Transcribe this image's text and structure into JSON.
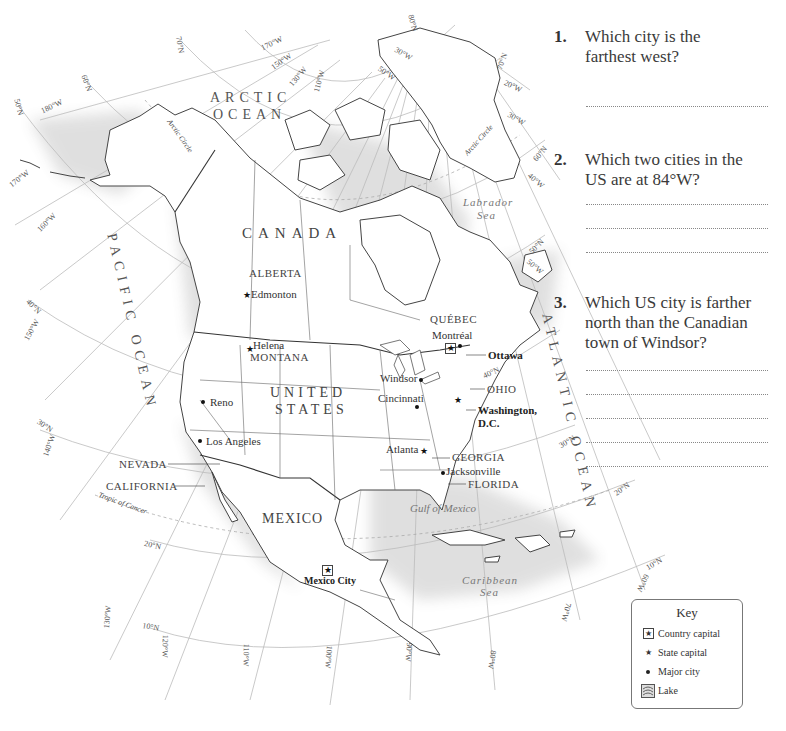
{
  "questions": [
    {
      "number": "1.",
      "lines": [
        "Which city is the",
        "farthest west?"
      ],
      "answer_lines": 1
    },
    {
      "number": "2.",
      "lines": [
        "Which two cities in the",
        "US are at 84°W?"
      ],
      "answer_lines": 3
    },
    {
      "number": "3.",
      "lines": [
        "Which US city is farther",
        "north than the Canadian",
        "town of Windsor?"
      ],
      "answer_lines": 5
    }
  ],
  "key": {
    "title": "Key",
    "items": [
      {
        "icon": "country-capital-icon",
        "label": "Country capital"
      },
      {
        "icon": "state-capital-icon",
        "label": "State capital"
      },
      {
        "icon": "major-city-icon",
        "label": "Major city"
      },
      {
        "icon": "lake-icon",
        "label": "Lake"
      }
    ]
  },
  "map": {
    "regions": {
      "arctic_1": "ARCTIC",
      "arctic_2": "OCEAN",
      "canada": "CANADA",
      "pacific": "PACIFIC OCEAN",
      "us_1": "UNITED",
      "us_2": "STATES",
      "mexico": "MEXICO",
      "atlantic": "ATLANTIC OCEAN",
      "labrador_1": "Labrador",
      "labrador_2": "Sea",
      "gulf": "Gulf of Mexico",
      "caribbean_1": "Caribbean",
      "caribbean_2": "Sea",
      "arctic_circle": "Arctic Circle",
      "tropic": "Tropic of Cancer"
    },
    "provinces": {
      "alberta": "ALBERTA",
      "quebec": "QUÉBEC",
      "montana": "MONTANA",
      "nevada": "NEVADA",
      "california": "CALIFORNIA",
      "ohio": "OHIO",
      "georgia": "GEORGIA",
      "florida": "FLORIDA"
    },
    "cities": {
      "edmonton": {
        "name": "Edmonton",
        "type": "state capital"
      },
      "helena": {
        "name": "Helena",
        "type": "state capital"
      },
      "reno": {
        "name": "Reno",
        "type": "major city"
      },
      "los_angeles": {
        "name": "Los Angeles",
        "type": "major city"
      },
      "montreal": {
        "name": "Montréal",
        "type": "major city"
      },
      "ottawa": {
        "name": "Ottawa",
        "type": "country capital"
      },
      "windsor": {
        "name": "Windsor",
        "type": "major city"
      },
      "cincinnati": {
        "name": "Cincinnati",
        "type": "major city"
      },
      "washington_1": {
        "name": "Washington,",
        "type": "country capital"
      },
      "washington_2": {
        "name": "D.C."
      },
      "atlanta": {
        "name": "Atlanta",
        "type": "state capital"
      },
      "jacksonville": {
        "name": "Jacksonville",
        "type": "major city"
      },
      "mexico_city": {
        "name": "Mexico City",
        "type": "country capital"
      }
    },
    "graticule": {
      "n70l": "70°N",
      "n60l": "60°N",
      "n50l": "50°N",
      "w180": "180°W",
      "w170l": "170°W",
      "w160": "160°W",
      "n40l": "40°N",
      "w150l": "150°W",
      "n30l": "30°N",
      "w140": "140°W",
      "w130l": "130°W",
      "n20l": "20°N",
      "n10l": "10°N",
      "w120": "120°W",
      "w110b": "110°W",
      "w100": "100°W",
      "w90": "90°W",
      "w80": "80°W",
      "w70": "70°W",
      "w60": "60°W",
      "n10r": "10°N",
      "n20r": "20°N",
      "n30r": "30°N",
      "n40r": "40°N",
      "n50r": "50°N",
      "w50r": "50°W",
      "n60r": "60°N",
      "w40r": "40°W",
      "n70r": "70°N",
      "w20r": "20°W",
      "w30r": "30°W",
      "w170t": "170°W",
      "w150t": "150°W",
      "w130t": "130°W",
      "w110t": "110°W",
      "n80": "80°N",
      "w30g": "30°W",
      "w50g": "50°W"
    }
  }
}
